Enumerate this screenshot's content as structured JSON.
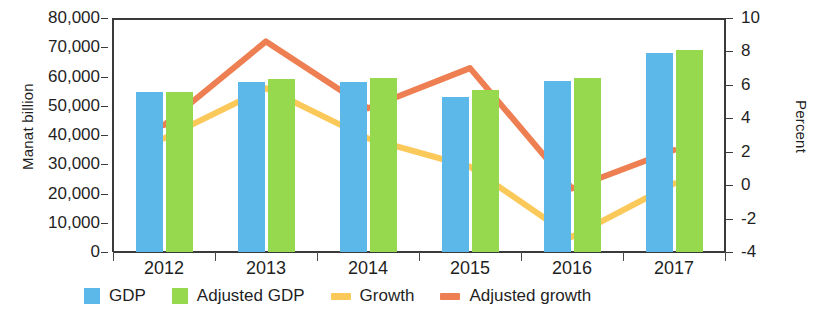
{
  "chart_data": {
    "type": "bar",
    "title": "",
    "subtitle": "",
    "categories": [
      "2012",
      "2013",
      "2014",
      "2015",
      "2016",
      "2017"
    ],
    "xlabel": "",
    "ylabel": "Manat billion",
    "y2label": "Percent",
    "ylim": [
      0,
      80000
    ],
    "y2lim": [
      -4,
      10
    ],
    "grid": false,
    "legend_position": "bottom",
    "y_ticks": [
      "0",
      "10,000",
      "20,000",
      "30,000",
      "40,000",
      "50,000",
      "60,000",
      "70,000",
      "80,000"
    ],
    "y_tick_values": [
      0,
      10000,
      20000,
      30000,
      40000,
      50000,
      60000,
      70000,
      80000
    ],
    "y2_ticks": [
      "-4",
      "-2",
      "0",
      "2",
      "4",
      "6",
      "8",
      "10"
    ],
    "y2_tick_values": [
      -4,
      -2,
      0,
      2,
      4,
      6,
      8,
      10
    ],
    "series": [
      {
        "name": "GDP",
        "type": "bar",
        "axis": "left",
        "color": "#5bb8e8",
        "values": [
          54700,
          58000,
          58000,
          52900,
          58500,
          68000
        ]
      },
      {
        "name": "Adjusted GDP",
        "type": "bar",
        "axis": "left",
        "color": "#97d94e",
        "values": [
          54700,
          59000,
          59600,
          55400,
          59600,
          69200
        ]
      },
      {
        "name": "Growth",
        "type": "line",
        "axis": "right",
        "color": "#fbc95a",
        "values": [
          2.8,
          5.8,
          2.8,
          1.1,
          -3.1,
          0.1
        ]
      },
      {
        "name": "Adjusted growth",
        "type": "line",
        "axis": "right",
        "color": "#ee7f52",
        "values": [
          3.6,
          8.6,
          4.6,
          7.0,
          -0.2,
          2.1
        ]
      }
    ],
    "legend": [
      {
        "label": "GDP",
        "marker": "square",
        "color": "#5bb8e8"
      },
      {
        "label": "Adjusted GDP",
        "marker": "square",
        "color": "#97d94e"
      },
      {
        "label": "Growth",
        "marker": "line",
        "color": "#fbc95a"
      },
      {
        "label": "Adjusted growth",
        "marker": "line",
        "color": "#ee7f52"
      }
    ]
  }
}
